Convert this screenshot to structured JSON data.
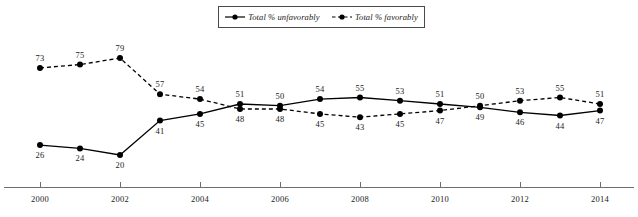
{
  "legend": {
    "position": "top-center",
    "entries": [
      {
        "label": "Total % unfavorably",
        "style": "solid",
        "marker": "filled-circle",
        "color": "#000000"
      },
      {
        "label": "Total % favorably",
        "style": "dashed",
        "marker": "filled-circle",
        "color": "#000000"
      }
    ]
  },
  "axis": {
    "tick_labels": [
      "2000",
      "2002",
      "2004",
      "2006",
      "2008",
      "2010",
      "2012",
      "2014"
    ],
    "line_color": "#6d6d6d"
  },
  "chart_data": {
    "type": "line",
    "title": "",
    "subtitle": "",
    "xlabel": "",
    "ylabel": "",
    "grid": false,
    "legend_position": "top-center",
    "x": [
      2000,
      2001,
      2002,
      2003,
      2004,
      2005,
      2006,
      2007,
      2008,
      2009,
      2010,
      2011,
      2012,
      2013,
      2014
    ],
    "categories": [
      "2000",
      "2001",
      "2002",
      "2003",
      "2004",
      "2005",
      "2006",
      "2007",
      "2008",
      "2009",
      "2010",
      "2011",
      "2012",
      "2013",
      "2014"
    ],
    "xtick_labels": [
      "2000",
      "2002",
      "2004",
      "2006",
      "2008",
      "2010",
      "2012",
      "2014"
    ],
    "xlim": [
      2000,
      2014
    ],
    "ylim": [
      15,
      82
    ],
    "data_labels": true,
    "series": [
      {
        "name": "Total % unfavorably",
        "style": "solid",
        "marker": "filled-circle",
        "color": "#000000",
        "values": [
          26,
          24,
          20,
          41,
          45,
          51,
          50,
          54,
          55,
          53,
          51,
          49,
          46,
          44,
          47
        ]
      },
      {
        "name": "Total % favorably",
        "style": "dashed",
        "marker": "filled-circle",
        "color": "#000000",
        "values": [
          73,
          75,
          79,
          57,
          54,
          48,
          48,
          45,
          43,
          45,
          47,
          50,
          53,
          55,
          51
        ]
      }
    ]
  }
}
